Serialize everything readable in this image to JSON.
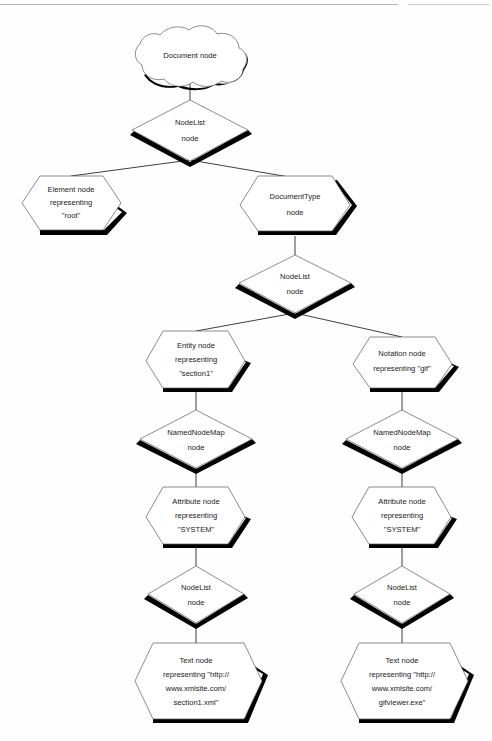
{
  "diagram": {
    "background_color": "#fefefe",
    "outline_color": "#5a5a5a",
    "shadow_color": "#000000",
    "connector_color": "#2a2a2a",
    "nodes": {
      "document": {
        "shape": "cloud",
        "lines": [
          "Document node"
        ]
      },
      "nodelist_root": {
        "shape": "diamond",
        "lines": [
          "NodeList",
          "node"
        ]
      },
      "element_root": {
        "shape": "hexagon",
        "lines": [
          "Element node",
          "representing",
          "\"root\""
        ]
      },
      "documenttype": {
        "shape": "hexagon",
        "lines": [
          "DocumentType",
          "node"
        ]
      },
      "nodelist_doctype": {
        "shape": "diamond",
        "lines": [
          "NodeList",
          "node"
        ]
      },
      "entity": {
        "shape": "hexagon",
        "lines": [
          "Entity node",
          "representing",
          "\"section1\""
        ]
      },
      "notation": {
        "shape": "hexagon",
        "lines": [
          "Notation node",
          "representing \"gif\""
        ]
      },
      "namednodemap_left": {
        "shape": "diamond",
        "lines": [
          "NamedNodeMap",
          "node"
        ]
      },
      "namednodemap_right": {
        "shape": "diamond",
        "lines": [
          "NamedNodeMap",
          "node"
        ]
      },
      "attribute_left": {
        "shape": "hexagon",
        "lines": [
          "Attribute node",
          "representing",
          "\"SYSTEM\""
        ]
      },
      "attribute_right": {
        "shape": "hexagon",
        "lines": [
          "Attribute node",
          "representing",
          "\"SYSTEM\""
        ]
      },
      "nodelist_attr_left": {
        "shape": "diamond",
        "lines": [
          "NodeList",
          "node"
        ]
      },
      "nodelist_attr_right": {
        "shape": "diamond",
        "lines": [
          "NodeList",
          "node"
        ]
      },
      "text_left": {
        "shape": "hexagon",
        "lines": [
          "Text node",
          "representing \"http://",
          "www.xmlsite.com/",
          "section1.xml\""
        ]
      },
      "text_right": {
        "shape": "hexagon",
        "lines": [
          "Text node",
          "representing \"http://",
          "www.xmlsite.com/",
          "gifviewer.exe\""
        ]
      }
    }
  }
}
